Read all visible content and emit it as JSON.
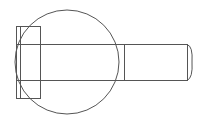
{
  "diagram": {
    "type": "technical-drawing",
    "colors": {
      "background": "#ffffff",
      "stroke": "#555555"
    },
    "head": {
      "x": 16,
      "y": 26,
      "width": 24,
      "height": 72,
      "inner_line_x": 20
    },
    "shank": {
      "top_y": 44,
      "bottom_y": 80,
      "start_x": 16,
      "end_x": 187,
      "thread_start_x": 124,
      "chamfer_tip_x": 192
    },
    "circle": {
      "cx": 67,
      "cy": 62,
      "r": 52
    }
  }
}
